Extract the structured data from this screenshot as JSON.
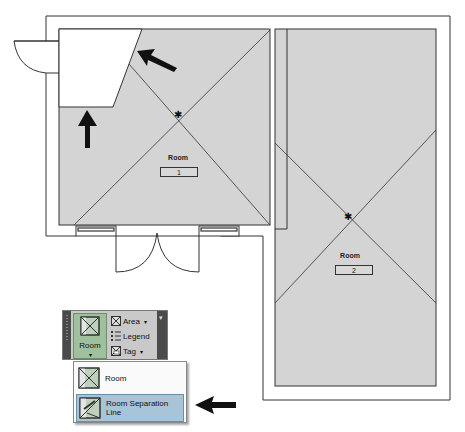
{
  "floor_plan": {
    "rooms": [
      {
        "name": "Room",
        "number": "1"
      },
      {
        "name": "Room",
        "number": "2"
      }
    ],
    "colors": {
      "room_fill": "#d4d4d4",
      "wall_line": "#333333",
      "unplaced_area": "#ffffff"
    }
  },
  "ribbon_panel": {
    "main_button": {
      "label": "Room",
      "caret": "▾",
      "icon": "room-icon"
    },
    "small_buttons": [
      {
        "label": "Area",
        "caret": "▾",
        "icon": "area-icon"
      },
      {
        "label": "Legend",
        "icon": "legend-icon"
      },
      {
        "label": "Tag",
        "caret": "▾",
        "icon": "tag-icon"
      }
    ],
    "panel_caret": "▾"
  },
  "dropdown_menu": {
    "items": [
      {
        "label": "Room",
        "icon": "room-icon",
        "highlighted": false
      },
      {
        "label": "Room Separation Line",
        "icon": "room-separation-line-icon",
        "highlighted": true
      }
    ],
    "highlight_color": "#a7c4d9"
  },
  "annotations": {
    "arrows": [
      "arrow-pointing-to-unbounded-edge",
      "arrow-pointing-to-unbounded-area",
      "arrow-pointing-to-room-separation-line"
    ]
  }
}
